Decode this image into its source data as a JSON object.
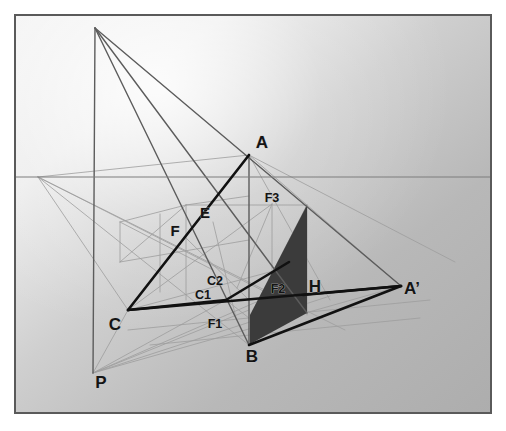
{
  "figure": {
    "type": "geometric-perspective-diagram",
    "canvas": {
      "width": 506,
      "height": 431
    },
    "frame": {
      "x": 14,
      "y": 14,
      "width": 478,
      "height": 400,
      "stroke": "#5a5a5a",
      "stroke_width": 2
    },
    "background": {
      "base_color": "#b3b3b3",
      "highlight_color": "#f2f2f2",
      "gradient_note": "diffuse light falloff from upper-left toward lower-right"
    },
    "colors": {
      "heavy_line": "#111111",
      "medium_line": "#555555",
      "construction_line": "#9a9a9a",
      "faint_line": "#a8a8a8",
      "shaded_face": "#3b3b3b",
      "label_text": "#141414"
    },
    "horizon": {
      "y": 177,
      "x1": 15,
      "x2": 491,
      "label": "horizon-line"
    },
    "vanishing_points": [
      {
        "name": "left-vanishing-point",
        "x": 38,
        "y": 177
      },
      {
        "name": "apex-point",
        "x": 95,
        "y": 28
      },
      {
        "name": "station-point-P",
        "x": 93,
        "y": 373
      }
    ],
    "points": [
      {
        "id": "A",
        "label": "A",
        "x": 249,
        "y": 155,
        "label_x": 262,
        "label_y": 148,
        "size": "big"
      },
      {
        "id": "B",
        "label": "B",
        "x": 249,
        "y": 345,
        "label_x": 252,
        "label_y": 362,
        "size": "big"
      },
      {
        "id": "C",
        "label": "C",
        "x": 128,
        "y": 310,
        "label_x": 115,
        "label_y": 330,
        "size": "big"
      },
      {
        "id": "Ap",
        "label": "A’",
        "x": 401,
        "y": 286,
        "label_x": 412,
        "label_y": 294,
        "size": "big"
      },
      {
        "id": "H",
        "label": "H",
        "x": 310,
        "y": 292,
        "label_x": 315,
        "label_y": 292,
        "size": "big"
      },
      {
        "id": "P",
        "label": "P",
        "x": 93,
        "y": 373,
        "label_x": 101,
        "label_y": 388,
        "size": "big"
      },
      {
        "id": "E",
        "label": "E",
        "x": 213,
        "y": 222,
        "label_x": 205,
        "label_y": 218,
        "size": "mid"
      },
      {
        "id": "F",
        "label": "F",
        "x": 186,
        "y": 238,
        "label_x": 175,
        "label_y": 236,
        "size": "mid"
      },
      {
        "id": "C1",
        "label": "C1",
        "x": 226,
        "y": 300,
        "label_x": 203,
        "label_y": 299,
        "size": "small"
      },
      {
        "id": "C2",
        "label": "C2",
        "x": 237,
        "y": 288,
        "label_x": 215,
        "label_y": 285,
        "size": "small"
      },
      {
        "id": "F1",
        "label": "F1",
        "x": 236,
        "y": 318,
        "label_x": 215,
        "label_y": 328,
        "size": "small"
      },
      {
        "id": "F2",
        "label": "F2",
        "x": 289,
        "y": 290,
        "label_x": 278,
        "label_y": 293,
        "size": "small"
      },
      {
        "id": "F3",
        "label": "F3",
        "x": 272,
        "y": 204,
        "label_x": 272,
        "label_y": 202,
        "size": "small"
      }
    ],
    "shaded_face": {
      "name": "shadow-face",
      "points": "250,315 307,205 307,313 250,344",
      "fill": "#3b3b3b"
    },
    "heavy_edges": [
      {
        "name": "edge-C-to-A",
        "x1": 128,
        "y1": 310,
        "x2": 249,
        "y2": 155
      },
      {
        "name": "edge-C-to-C1",
        "x1": 128,
        "y1": 310,
        "x2": 226,
        "y2": 300
      },
      {
        "name": "edge-C1-to-F2",
        "x1": 226,
        "y1": 300,
        "x2": 289,
        "y2": 262
      },
      {
        "name": "edge-C-to-Aprime",
        "x1": 128,
        "y1": 310,
        "x2": 401,
        "y2": 286
      },
      {
        "name": "edge-H-to-Aprime",
        "x1": 303,
        "y1": 295,
        "x2": 401,
        "y2": 286
      },
      {
        "name": "edge-B-to-Aprime",
        "x1": 249,
        "y1": 345,
        "x2": 401,
        "y2": 286
      }
    ],
    "medium_edges": [
      {
        "name": "vertical-AB",
        "x1": 249,
        "y1": 155,
        "x2": 249,
        "y2": 345
      },
      {
        "name": "vertical-left-mast",
        "x1": 95,
        "y1": 28,
        "x2": 93,
        "y2": 373
      },
      {
        "name": "ray-apex-to-Aprime",
        "x1": 95,
        "y1": 28,
        "x2": 401,
        "y2": 286
      },
      {
        "name": "ray-apex-to-B",
        "x1": 95,
        "y1": 28,
        "x2": 249,
        "y2": 345
      },
      {
        "name": "ray-apex-to-H",
        "x1": 95,
        "y1": 28,
        "x2": 307,
        "y2": 313
      }
    ],
    "construction_edges": [
      {
        "name": "lvp-to-A",
        "x1": 38,
        "y1": 177,
        "x2": 249,
        "y2": 155
      },
      {
        "name": "lvp-to-B",
        "x1": 38,
        "y1": 177,
        "x2": 249,
        "y2": 345
      },
      {
        "name": "lvp-to-C",
        "x1": 38,
        "y1": 177,
        "x2": 128,
        "y2": 310
      },
      {
        "name": "lvp-to-F1",
        "x1": 38,
        "y1": 177,
        "x2": 307,
        "y2": 313
      },
      {
        "name": "lvp-to-shadowfoot",
        "x1": 38,
        "y1": 177,
        "x2": 345,
        "y2": 330
      },
      {
        "name": "A-to-Aprime",
        "x1": 249,
        "y1": 155,
        "x2": 401,
        "y2": 286
      },
      {
        "name": "A-to-H-ray",
        "x1": 249,
        "y1": 155,
        "x2": 330,
        "y2": 300
      },
      {
        "name": "A-to-C-construction",
        "x1": 249,
        "y1": 155,
        "x2": 128,
        "y2": 310
      },
      {
        "name": "F3-horizontal",
        "x1": 186,
        "y1": 205,
        "x2": 307,
        "y2": 205
      },
      {
        "name": "F3-down",
        "x1": 272,
        "y1": 204,
        "x2": 272,
        "y2": 316
      },
      {
        "name": "right-shadow-vertical",
        "x1": 307,
        "y1": 205,
        "x2": 307,
        "y2": 315
      },
      {
        "name": "top-shadow-slant",
        "x1": 250,
        "y1": 316,
        "x2": 307,
        "y2": 205
      },
      {
        "name": "box-top-left",
        "x1": 120,
        "y1": 222,
        "x2": 186,
        "y2": 205
      },
      {
        "name": "box-top-right",
        "x1": 186,
        "y1": 205,
        "x2": 249,
        "y2": 196
      },
      {
        "name": "box-left-vert",
        "x1": 120,
        "y1": 222,
        "x2": 120,
        "y2": 262
      },
      {
        "name": "box-mid-vert",
        "x1": 160,
        "y1": 214,
        "x2": 160,
        "y2": 292
      },
      {
        "name": "box-right-vert",
        "x1": 186,
        "y1": 205,
        "x2": 186,
        "y2": 300
      },
      {
        "name": "box-bottom",
        "x1": 120,
        "y1": 262,
        "x2": 249,
        "y2": 240
      },
      {
        "name": "diag-box-1",
        "x1": 120,
        "y1": 222,
        "x2": 213,
        "y2": 270
      },
      {
        "name": "diag-box-2",
        "x1": 186,
        "y1": 205,
        "x2": 120,
        "y2": 262
      },
      {
        "name": "C-to-F3",
        "x1": 128,
        "y1": 310,
        "x2": 272,
        "y2": 204
      },
      {
        "name": "C-to-F2",
        "x1": 128,
        "y1": 310,
        "x2": 307,
        "y2": 262
      },
      {
        "name": "P-to-C",
        "x1": 93,
        "y1": 373,
        "x2": 128,
        "y2": 310
      },
      {
        "name": "P-to-C1",
        "x1": 93,
        "y1": 373,
        "x2": 226,
        "y2": 300
      },
      {
        "name": "P-to-F1",
        "x1": 93,
        "y1": 373,
        "x2": 249,
        "y2": 310
      },
      {
        "name": "P-to-F2",
        "x1": 93,
        "y1": 373,
        "x2": 307,
        "y2": 280
      },
      {
        "name": "P-to-H",
        "x1": 93,
        "y1": 373,
        "x2": 330,
        "y2": 296
      },
      {
        "name": "P-to-Aprime",
        "x1": 93,
        "y1": 373,
        "x2": 401,
        "y2": 286
      },
      {
        "name": "ground-line-front",
        "x1": 128,
        "y1": 330,
        "x2": 430,
        "y2": 300
      },
      {
        "name": "ground-line-back",
        "x1": 150,
        "y1": 345,
        "x2": 420,
        "y2": 318
      },
      {
        "name": "E-to-F1",
        "x1": 213,
        "y1": 222,
        "x2": 236,
        "y2": 318
      },
      {
        "name": "F-to-C1",
        "x1": 186,
        "y1": 238,
        "x2": 249,
        "y2": 300
      },
      {
        "name": "C1-to-F1",
        "x1": 226,
        "y1": 300,
        "x2": 249,
        "y2": 318
      },
      {
        "name": "C2-to-F3",
        "x1": 237,
        "y1": 288,
        "x2": 272,
        "y2": 204
      },
      {
        "name": "long-right-ray",
        "x1": 249,
        "y1": 155,
        "x2": 455,
        "y2": 262
      }
    ]
  }
}
